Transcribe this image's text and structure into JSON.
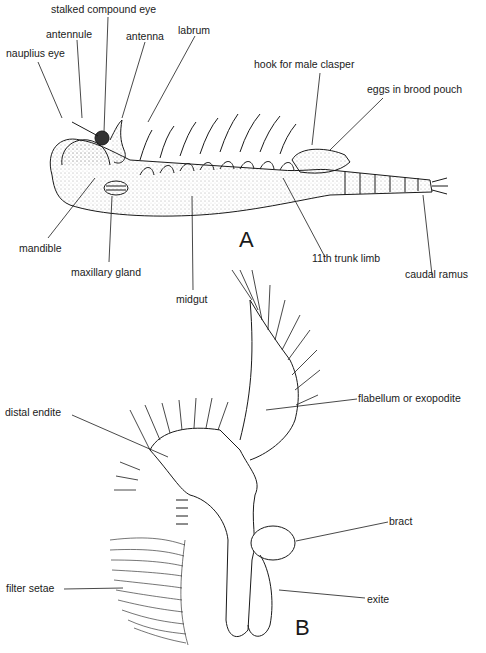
{
  "figure_a": {
    "panel_letter": "A",
    "labels": {
      "stalked_compound_eye": "stalked compound eye",
      "antennule": "antennule",
      "antenna": "antenna",
      "labrum": "labrum",
      "nauplius_eye": "nauplius eye",
      "hook_for_male_clasper": "hook for male clasper",
      "eggs_in_brood_pouch": "eggs in brood pouch",
      "mandible": "mandible",
      "maxillary_gland": "maxillary gland",
      "midgut": "midgut",
      "trunk_limb": "11th trunk limb",
      "caudal_ramus": "caudal ramus"
    }
  },
  "figure_b": {
    "panel_letter": "B",
    "labels": {
      "flabellum": "flabellum or exopodite",
      "distal_endite": "distal endite",
      "bract": "bract",
      "exite": "exite",
      "filter_setae": "filter setae"
    }
  }
}
